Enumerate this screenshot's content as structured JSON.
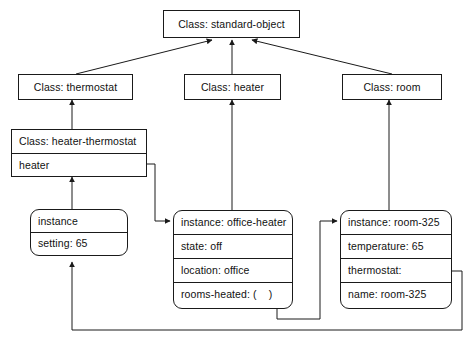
{
  "diagram": {
    "line_color": "#1a1a1a",
    "text_color": "#111111",
    "background": "#ffffff"
  },
  "classes": {
    "standard_object": {
      "label": "Class: standard-object"
    },
    "thermostat": {
      "label": "Class: thermostat"
    },
    "heater": {
      "label": "Class: heater"
    },
    "room": {
      "label": "Class: room"
    },
    "heater_thermostat": {
      "label": "Class: heater-thermostat",
      "slots": [
        {
          "label": "heater"
        }
      ]
    }
  },
  "instances": {
    "thermostat_instance": {
      "header": "instance",
      "slots": [
        {
          "label": "setting: 65"
        }
      ]
    },
    "office_heater": {
      "header": "instance: office-heater",
      "slots": [
        {
          "label": "state: off"
        },
        {
          "label": "location: office"
        },
        {
          "label": "rooms-heated: (",
          "label_tail": ")"
        }
      ]
    },
    "room_325": {
      "header": "instance: room-325",
      "slots": [
        {
          "label": "temperature: 65"
        },
        {
          "label": "thermostat:"
        },
        {
          "label": "name: room-325"
        }
      ]
    }
  }
}
